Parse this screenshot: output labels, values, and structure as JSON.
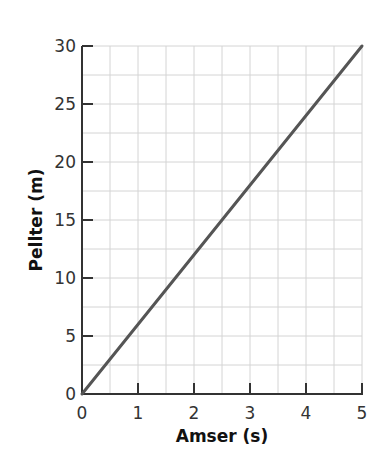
{
  "chart_data": {
    "type": "line",
    "title": "",
    "xlabel": "Amser (s)",
    "ylabel": "Pellter (m)",
    "xlim": [
      0,
      5
    ],
    "ylim": [
      0,
      30
    ],
    "x_ticks": [
      0,
      1,
      2,
      3,
      4,
      5
    ],
    "y_ticks": [
      0,
      5,
      10,
      15,
      20,
      25,
      30
    ],
    "grid": true,
    "grid_minor_x_step": 0.5,
    "grid_minor_y_step": 2.5,
    "legend": null,
    "series": [
      {
        "name": "distance",
        "x": [
          0,
          5
        ],
        "y": [
          0,
          30
        ],
        "color": "#555555"
      }
    ]
  },
  "labels": {
    "xlabel": "Amser (s)",
    "ylabel": "Pellter (m)"
  },
  "colors": {
    "grid": "#d4d4d4",
    "axis": "#333333",
    "line": "#555555"
  }
}
